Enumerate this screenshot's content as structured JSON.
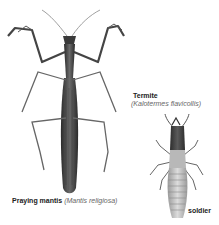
{
  "figure": {
    "mantis": {
      "common_name": "Praying mantis",
      "scientific_name": "(Mantis religiosa)",
      "icon": "praying-mantis-illustration"
    },
    "termite": {
      "common_name": "Termite",
      "scientific_name": "(Kalotermes flavicollis)",
      "caste_label": "soldier",
      "icon": "termite-soldier-illustration"
    },
    "colors": {
      "background": "#ffffff",
      "ink_dark": "#2e2e2e",
      "ink_mid": "#6a6a6a",
      "ink_light": "#a8a8a8",
      "label_text": "#222222",
      "sci_text": "#666666"
    }
  }
}
